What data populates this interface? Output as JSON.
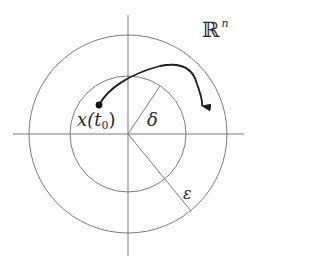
{
  "diagram": {
    "space_label": {
      "base": "ℝ",
      "superscript": "n"
    },
    "initial_point_label": {
      "prefix": "x(t",
      "subscript": "0",
      "suffix": ")"
    },
    "inner_radius_label": "δ",
    "outer_radius_label": "ε",
    "geometry": {
      "center": [
        128,
        134
      ],
      "inner_circle_radius": 58,
      "outer_circle_radius": 99,
      "horizontal_axis": {
        "x1": 13,
        "x2": 244,
        "y": 134
      },
      "vertical_axis": {
        "x": 128,
        "y1": 15,
        "y2": 256
      },
      "delta_radius_end": [
        160,
        86
      ],
      "epsilon_radius_end": [
        191,
        211
      ],
      "initial_point": [
        99,
        105
      ],
      "trajectory_end": [
        202,
        114
      ]
    },
    "colors": {
      "background": "#ffffff",
      "guide_lines": "#7a7a7a",
      "trajectory": "#1e1e1e",
      "text": "#2a2a2a"
    }
  }
}
